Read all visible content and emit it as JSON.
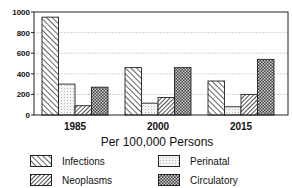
{
  "chart_data": {
    "type": "bar",
    "title": "",
    "xlabel": "Per 100,000 Persons",
    "ylabel": "",
    "ylim": [
      0,
      1000
    ],
    "yticks": [
      0,
      200,
      400,
      600,
      800,
      1000
    ],
    "grid": true,
    "legend_position": "bottom",
    "categories": [
      "1985",
      "2000",
      "2015"
    ],
    "series": [
      {
        "name": "Infections",
        "pattern": "diagonal-hatch",
        "values": [
          950,
          460,
          330
        ]
      },
      {
        "name": "Perinatal",
        "pattern": "light-dots",
        "values": [
          300,
          115,
          80
        ]
      },
      {
        "name": "Neoplasms",
        "pattern": "dense-diagonal-hatch",
        "values": [
          90,
          170,
          200
        ]
      },
      {
        "name": "Circulatory",
        "pattern": "crosshatch-dark",
        "values": [
          270,
          460,
          540
        ]
      }
    ]
  },
  "legend": {
    "items": [
      {
        "label": "Infections"
      },
      {
        "label": "Perinatal"
      },
      {
        "label": "Neoplasms"
      },
      {
        "label": "Circulatory"
      }
    ]
  }
}
